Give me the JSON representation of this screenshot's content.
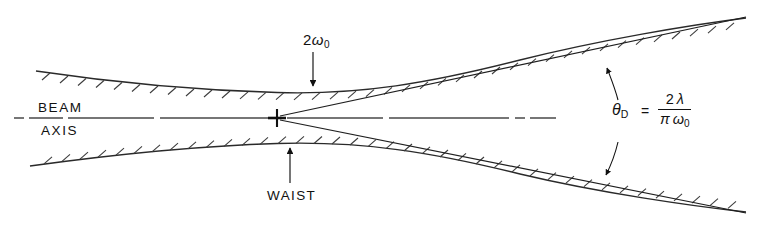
{
  "figure": {
    "name": "gaussian-beam-propagation-diagram",
    "background_color": "#ffffff",
    "line_color": "#111111",
    "width": 784,
    "height": 228
  },
  "labels": {
    "beam": "BEAM",
    "axis": "AXIS",
    "waist": "WAIST",
    "spot_size_prefix": "2",
    "spot_size_symbol": "ω",
    "spot_size_subscript": "0",
    "theta_symbol": "θ",
    "theta_subscript": "D",
    "equals": "=",
    "numerator_coeff": "2",
    "numerator_symbol": "λ",
    "denominator_pi": "π",
    "denominator_omega": "ω",
    "denominator_subscript": "0"
  },
  "geometry": {
    "axis_y": 118,
    "waist_x": 277,
    "upper_curve_start": [
      36,
      71
    ],
    "upper_curve_end": [
      746,
      18
    ],
    "lower_curve_start": [
      30,
      166
    ],
    "lower_curve_end": [
      746,
      212
    ],
    "asymptote_upper_end": [
      746,
      17
    ],
    "asymptote_lower_end": [
      746,
      213
    ],
    "hatch_tick_length": 11,
    "axis_left_x": 14,
    "axis_right_x": 556
  },
  "annotations": {
    "spot_arrow": {
      "from": [
        313,
        52
      ],
      "to": [
        313,
        88
      ],
      "direction": "down"
    },
    "waist_arrow": {
      "from": [
        290,
        183
      ],
      "to": [
        290,
        146
      ],
      "direction": "up"
    },
    "divergence_arc": {
      "top_tip": [
        606,
        66
      ],
      "bottom_tip": [
        606,
        177
      ],
      "double_headed": true
    }
  }
}
